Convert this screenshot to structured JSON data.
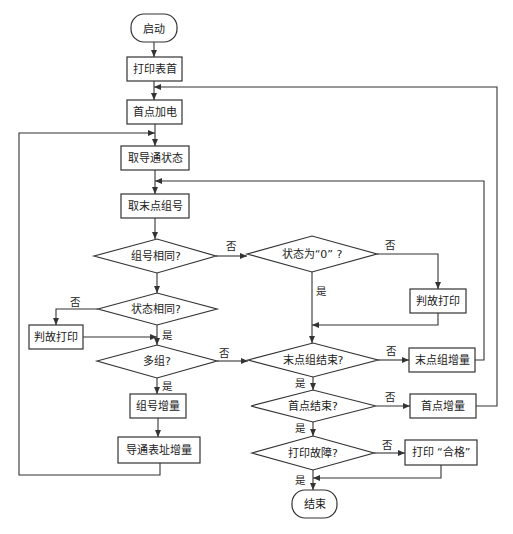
{
  "nodes": {
    "start": "启动",
    "print_header": "打印表首",
    "first_point_power": "首点加电",
    "get_conduction_state": "取导通状态",
    "get_end_point_group": "取末点组号",
    "group_same": "组号相同?",
    "state_zero": "状态为“0” ?",
    "fault_print_right": "判故打印",
    "state_same": "状态相同?",
    "fault_print_left": "判故打印",
    "multi_group": "多组?",
    "end_group_done": "末点组结束?",
    "end_group_increment": "末点组增量",
    "group_increment": "组号增量",
    "first_point_done": "首点结束?",
    "first_point_increment": "首点增量",
    "conduction_table_increment": "导通表址增量",
    "print_fault": "打印故障?",
    "print_pass": "打印 “合格”",
    "end": "结束"
  },
  "edge_labels": {
    "yes": "是",
    "no": "否"
  }
}
